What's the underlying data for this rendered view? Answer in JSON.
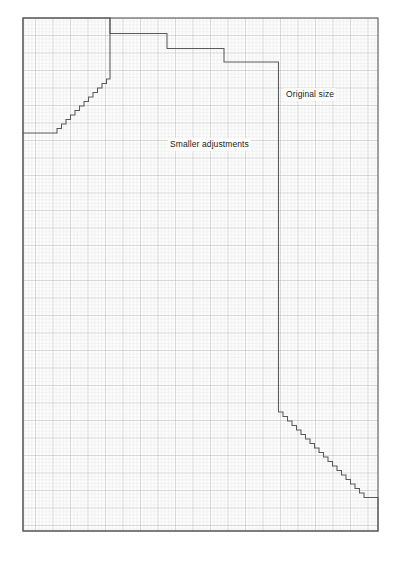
{
  "diagram": {
    "background_color": "#ffffff",
    "labels": [
      {
        "id": "original-size",
        "text": "Original size"
      },
      {
        "id": "smaller-adjustments",
        "text": "Smaller adjustments"
      }
    ],
    "grid": {
      "minor_cell_px": 3.5,
      "major_every": 5,
      "minor_color": "#dcdcdc",
      "major_color": "#bcbcbc",
      "frame_color": "#555555",
      "fill_color": "#fdfdfd",
      "frame": {
        "x": 23,
        "y": 18,
        "width": 355,
        "height": 513
      }
    },
    "outlines": [
      {
        "id": "original-size-outline",
        "stroke": "#5a5a5a",
        "stroke_width": 1,
        "description": "Stepped outline of the original size pattern piece with three large steps at the top and a diagonal staircase at the bottom right"
      },
      {
        "id": "smaller-adjustments-outline",
        "stroke": "#5a5a5a",
        "stroke_width": 1,
        "description": "Inner reduced outline with a small staircase at the upper left"
      }
    ],
    "step_counts": {
      "top_large_steps": 3,
      "upper_left_small_steps": 11,
      "lower_right_small_steps": 21
    }
  }
}
